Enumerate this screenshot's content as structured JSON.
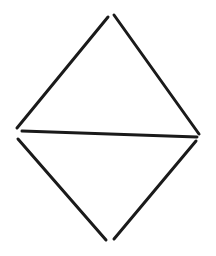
{
  "canvas": {
    "width": 216,
    "height": 256,
    "background_color": "#ffffff",
    "title": "Hand-drawn diamond with horizontal bisector"
  },
  "figure": {
    "name": "diamond-with-horizontal-chord",
    "stroke_color": "#1a1a1a",
    "stroke_width": 3,
    "stroke_linecap": "round",
    "vertices": [
      {
        "name": "top-vertex",
        "x": 111,
        "y": 16
      },
      {
        "name": "left-vertex",
        "x": 18,
        "y": 133
      },
      {
        "name": "right-vertex",
        "x": 198,
        "y": 137
      },
      {
        "name": "bottom-vertex",
        "x": 110,
        "y": 240
      }
    ],
    "strokes": [
      {
        "name": "upper-left-edge",
        "x1": 108,
        "y1": 17,
        "x2": 17,
        "y2": 128
      },
      {
        "name": "upper-right-edge",
        "x1": 114,
        "y1": 15,
        "x2": 199,
        "y2": 134
      },
      {
        "name": "horizontal-chord",
        "x1": 22,
        "y1": 131,
        "x2": 197,
        "y2": 137
      },
      {
        "name": "lower-left-edge",
        "x1": 18,
        "y1": 139,
        "x2": 106,
        "y2": 240
      },
      {
        "name": "lower-right-edge",
        "x1": 196,
        "y1": 141,
        "x2": 114,
        "y2": 239
      }
    ]
  }
}
